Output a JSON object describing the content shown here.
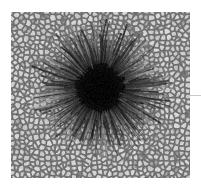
{
  "figure": {
    "name": "sunspot-image",
    "kind": "natural-image",
    "canvas": {
      "width": 201,
      "height": 186,
      "background": "#ffffff"
    },
    "frame": {
      "x": 11,
      "y": 12,
      "width": 179,
      "height": 166
    },
    "edge_marker": {
      "name": "right-edge-tick",
      "x": 188,
      "y": 95,
      "width": 13,
      "height": 1,
      "color": "#c9c9c9"
    }
  },
  "scene": {
    "granulation": {
      "cell_size_px": 5.2,
      "bright_color": "#cfcfcf",
      "mid_color": "#a5a5a5",
      "lane_color": "#6d6d6d",
      "peak_color": "#e2e2e2"
    },
    "sunspot": {
      "center_x": 100,
      "center_y": 88,
      "umbra_radius": 24,
      "umbra_color": "#070707",
      "penumbra_inner_radius": 24,
      "penumbra_outer_radius": 66,
      "penumbra_dark_color": "#1b1b1b",
      "penumbra_light_color": "#b4b4b4",
      "filament_count": 420,
      "umbra_irregularity": 0.18
    },
    "noise": {
      "amount": 16,
      "seed": 20240517
    }
  }
}
